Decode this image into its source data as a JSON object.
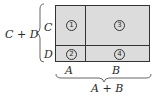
{
  "diagram": {
    "regions": [
      {
        "id": "1",
        "label": "①",
        "row": "C",
        "col": "A"
      },
      {
        "id": "2",
        "label": "②",
        "row": "D",
        "col": "A"
      },
      {
        "id": "3",
        "label": "③",
        "row": "C",
        "col": "B"
      },
      {
        "id": "4",
        "label": "④",
        "row": "D",
        "col": "B"
      }
    ],
    "row_labels": [
      "C",
      "D"
    ],
    "col_labels": [
      "A",
      "B"
    ],
    "left_brace_label": "C + D",
    "bottom_brace_label": "A + B",
    "colors": {
      "fill": "#dcdcdc",
      "stroke": "#333333"
    }
  }
}
